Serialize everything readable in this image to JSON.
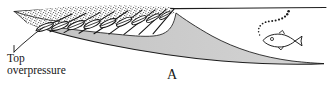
{
  "figure": {
    "panel_label": "A",
    "annotation": {
      "line1": "Top",
      "line2": "overpressure"
    },
    "colors": {
      "wedge_fill": "#c9c9c9",
      "stipple_fill": "#fdfdfd",
      "stipple_dot": "#3c3c3c",
      "line": "#1d1d1d",
      "lens_fill": "#ffffff",
      "background": "#ffffff"
    },
    "elements": {
      "surface_line": "seafloor-surface-line",
      "stippled_body": "overpressured-sand-body",
      "gray_wedge": "sediment-wedge",
      "fracture_lenses": "hydrofracture-lens-array",
      "fracture_lines": "fracture-line-array",
      "leader_line": "annotation-leader-line",
      "fish": "fish-icon",
      "bubble_trail": "gas-bubble-trail"
    },
    "counts": {
      "lenses": 9,
      "bubbles": 14
    }
  }
}
